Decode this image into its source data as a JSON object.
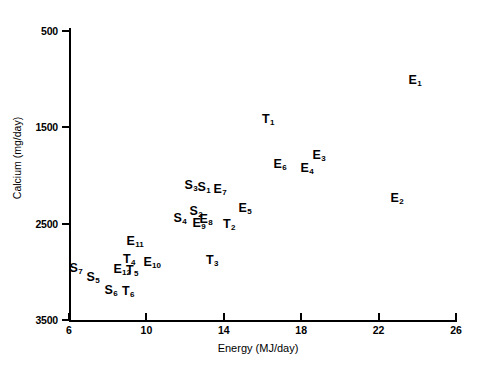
{
  "chart_data": {
    "type": "scatter",
    "title": "",
    "xlabel": "Energy (MJ/day)",
    "ylabel": "Calcium (mg/day)",
    "xlim": [
      6,
      26
    ],
    "ylim": [
      500,
      3500
    ],
    "xticks": [
      6,
      10,
      14,
      18,
      22,
      26
    ],
    "yticks": [
      500,
      1500,
      2500,
      3500
    ],
    "grid": false,
    "legend": "none",
    "point_style": "text-label",
    "points": [
      {
        "label": "E",
        "sub": "1",
        "x": 23.9,
        "y": 2990,
        "px": 415,
        "py": 80
      },
      {
        "label": "E",
        "sub": "2",
        "x": 22.9,
        "y": 1735,
        "px": 397,
        "py": 198
      },
      {
        "label": "E",
        "sub": "3",
        "x": 18.9,
        "y": 2195,
        "px": 319,
        "py": 155
      },
      {
        "label": "E",
        "sub": "4",
        "x": 18.3,
        "y": 2060,
        "px": 307,
        "py": 168
      },
      {
        "label": "E",
        "sub": "5",
        "x": 15.1,
        "y": 1630,
        "px": 245,
        "py": 208
      },
      {
        "label": "E",
        "sub": "6",
        "x": 16.9,
        "y": 2100,
        "px": 280,
        "py": 164
      },
      {
        "label": "E",
        "sub": "7",
        "x": 13.8,
        "y": 1835,
        "px": 220,
        "py": 189
      },
      {
        "label": "E",
        "sub": "8",
        "x": 13.1,
        "y": 1520,
        "px": 206,
        "py": 219
      },
      {
        "label": "E",
        "sub": "9",
        "x": 12.7,
        "y": 1480,
        "px": 199,
        "py": 223
      },
      {
        "label": "E",
        "sub": "10",
        "x": 10.3,
        "y": 1070,
        "px": 152,
        "py": 262
      },
      {
        "label": "E",
        "sub": "11",
        "x": 9.4,
        "y": 1290,
        "px": 135,
        "py": 241
      },
      {
        "label": "E",
        "sub": "12",
        "x": 9.5,
        "y": 995,
        "px": 122,
        "py": 269
      },
      {
        "label": "S",
        "sub": "1",
        "x": 13.0,
        "y": 1860,
        "px": 204,
        "py": 187
      },
      {
        "label": "S",
        "sub": "2",
        "x": 12.4,
        "y": 1600,
        "px": 196,
        "py": 211
      },
      {
        "label": "S",
        "sub": "3",
        "x": 12.2,
        "y": 1875,
        "px": 191,
        "py": 185
      },
      {
        "label": "S",
        "sub": "4",
        "x": 11.5,
        "y": 1530,
        "px": 180,
        "py": 218
      },
      {
        "label": "S",
        "sub": "5",
        "x": 7.3,
        "y": 1010,
        "px": 93,
        "py": 277
      },
      {
        "label": "S",
        "sub": "6",
        "x": 9.0,
        "y": 880,
        "px": 111,
        "py": 290
      },
      {
        "label": "S",
        "sub": "7",
        "x": 6.4,
        "y": 1110,
        "px": 76,
        "py": 268
      },
      {
        "label": "T",
        "sub": "1",
        "x": 16.3,
        "y": 2600,
        "px": 268,
        "py": 119
      },
      {
        "label": "T",
        "sub": "2",
        "x": 14.2,
        "y": 1470,
        "px": 229,
        "py": 224
      },
      {
        "label": "T",
        "sub": "3",
        "x": 13.4,
        "y": 1090,
        "px": 212,
        "py": 260
      },
      {
        "label": "T",
        "sub": "4",
        "x": 9.7,
        "y": 1095,
        "px": 129,
        "py": 259
      },
      {
        "label": "T",
        "sub": "5",
        "x": 9.8,
        "y": 985,
        "px": 132,
        "py": 270
      },
      {
        "label": "T",
        "sub": "6",
        "x": 9.2,
        "y": 870,
        "px": 128,
        "py": 291
      }
    ]
  },
  "axes": {
    "y_title": "Calcium (mg/day)",
    "x_title": "Energy (MJ/day)",
    "y_tick_labels": [
      "3500",
      "2500",
      "1500",
      "500"
    ],
    "x_tick_labels": [
      "6",
      "10",
      "14",
      "18",
      "22",
      "26"
    ]
  },
  "colors": {
    "background": "#ffffff",
    "foreground": "#000000"
  }
}
